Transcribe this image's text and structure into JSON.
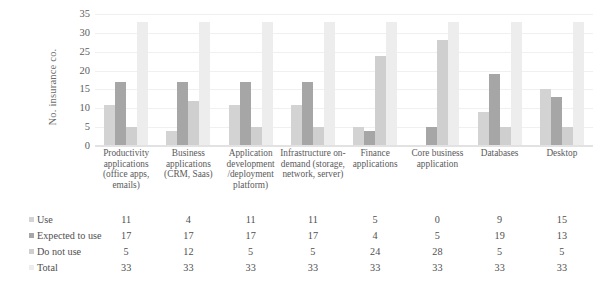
{
  "chart_data": {
    "type": "bar",
    "title": "",
    "subtitle": "",
    "xlabel": "",
    "ylabel": "No. insurance co.",
    "ylim": [
      0,
      35
    ],
    "ytick_step": 5,
    "yticks": [
      0,
      5,
      10,
      15,
      20,
      25,
      30,
      35
    ],
    "grid": false,
    "legend_position": "left-table",
    "orientation": "vertical",
    "grouping": "clustered",
    "categories": [
      "Productivity applications (office apps, emails)",
      "Business applications (CRM, Saas)",
      "Application development /deployment platform)",
      "Infrastructure on-demand (storage, network, server)",
      "Finance applications",
      "Core business application",
      "Databases",
      "Desktop"
    ],
    "series": [
      {
        "name": "Use",
        "color": "#d3d3d3",
        "values": [
          11,
          4,
          11,
          11,
          5,
          0,
          9,
          15
        ]
      },
      {
        "name": "Expected to use",
        "color": "#a6a6a6",
        "values": [
          17,
          17,
          17,
          17,
          4,
          5,
          19,
          13
        ]
      },
      {
        "name": "Do not use",
        "color": "#cfcfcf",
        "values": [
          5,
          12,
          5,
          5,
          24,
          28,
          5,
          5
        ]
      },
      {
        "name": "Total",
        "color": "#ededed",
        "values": [
          33,
          33,
          33,
          33,
          33,
          33,
          33,
          33
        ]
      }
    ]
  },
  "axis": {
    "y_title": "No. insurance co.",
    "y_tick_labels": [
      "35",
      "30",
      "25",
      "20",
      "15",
      "10",
      "5",
      "0"
    ]
  },
  "data_table": {
    "row_labels": [
      "Use",
      "Expected to use",
      "Do not use",
      "Total"
    ],
    "rows": [
      [
        "11",
        "4",
        "11",
        "11",
        "5",
        "0",
        "9",
        "15"
      ],
      [
        "17",
        "17",
        "17",
        "17",
        "4",
        "5",
        "19",
        "13"
      ],
      [
        "5",
        "12",
        "5",
        "5",
        "24",
        "28",
        "5",
        "5"
      ],
      [
        "33",
        "33",
        "33",
        "33",
        "33",
        "33",
        "33",
        "33"
      ]
    ]
  }
}
